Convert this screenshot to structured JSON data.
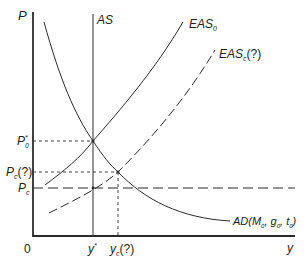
{
  "diagram": {
    "type": "economics-supply-demand",
    "axes": {
      "y_label": "P",
      "x_label": "y",
      "origin_label": "0"
    },
    "curves": {
      "as": {
        "label": "AS",
        "style": "solid-vertical"
      },
      "eas0": {
        "label": "EAS",
        "subscript": "0",
        "style": "solid"
      },
      "easc": {
        "label": "EAS",
        "subscript": "c",
        "suffix": "(?)",
        "style": "dashed"
      },
      "ad": {
        "label": "AD(M",
        "sub1": "0",
        "mid1": ", g",
        "sub2": "0",
        "mid2": ", t",
        "sub3": "0",
        "end": ")",
        "style": "solid"
      }
    },
    "y_ticks": {
      "p0star": {
        "label": "P",
        "sub": "0",
        "sup": "*"
      },
      "pc_q": {
        "label": "P",
        "sub": "c",
        "suffix": "(?)"
      },
      "pc": {
        "label": "P",
        "sub": "c"
      }
    },
    "x_ticks": {
      "ystar": {
        "label": "y",
        "sup": "*"
      },
      "yc_q": {
        "label": "y",
        "sub": "c",
        "suffix": "(?)"
      }
    },
    "colors": {
      "line": "#2a2a2a",
      "background": "#ffffff"
    }
  }
}
